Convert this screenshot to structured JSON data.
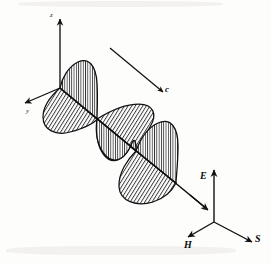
{
  "figure": {
    "background_color": "#fdfdfc",
    "ink_color": "#111111",
    "hatch_color": "#1b1b1b"
  },
  "axes": {
    "origin_left": {
      "x": 60,
      "y": 88
    },
    "origin_right": {
      "x": 214,
      "y": 222
    },
    "items": [
      {
        "name": "z-axis",
        "label": "z",
        "direction": "up",
        "tip": {
          "x": 60,
          "y": 16
        },
        "label_pos": {
          "x": 51,
          "y": 15
        }
      },
      {
        "name": "y-axis",
        "label": "y",
        "direction": "down-left",
        "tip": {
          "x": 22,
          "y": 105
        },
        "label_pos": {
          "x": 26,
          "y": 112
        }
      },
      {
        "name": "x-axis",
        "label": "x",
        "direction": "down-right",
        "tip": {
          "x": 206,
          "y": 208
        },
        "label_pos": {
          "x": 205,
          "y": 209
        }
      },
      {
        "name": "E-vector",
        "label": "E",
        "direction": "up",
        "tip": {
          "x": 214,
          "y": 168
        },
        "label_pos": {
          "x": 201,
          "y": 168
        }
      },
      {
        "name": "H-vector",
        "label": "H",
        "direction": "down-left",
        "tip": {
          "x": 186,
          "y": 238
        },
        "label_pos": {
          "x": 186,
          "y": 244
        }
      },
      {
        "name": "S-vector",
        "label": "S",
        "direction": "down-right",
        "tip": {
          "x": 254,
          "y": 243
        },
        "label_pos": {
          "x": 256,
          "y": 237
        }
      },
      {
        "name": "c-vector",
        "label": "c",
        "direction": "down-right",
        "tip": {
          "x": 163,
          "y": 93
        },
        "label_pos": {
          "x": 165,
          "y": 88
        }
      }
    ]
  },
  "wave": {
    "description": "Transverse electromagnetic plane wave: electric field lobes in the vertical plane, magnetic field lobes in the horizontal plane, propagating along c.",
    "propagation_axis": {
      "start": {
        "x": 60,
        "y": 88
      },
      "end": {
        "x": 212,
        "y": 213
      }
    },
    "lobes": [
      {
        "id": "lobe-e-1",
        "field": "E",
        "plane": "vertical",
        "hatch": "vertical",
        "side": "upper",
        "node_start": {
          "x": 60,
          "y": 88
        },
        "node_end": {
          "x": 97,
          "y": 119
        }
      },
      {
        "id": "lobe-h-1",
        "field": "H",
        "plane": "horizontal",
        "hatch": "diagonal",
        "side": "lower",
        "node_start": {
          "x": 60,
          "y": 88
        },
        "node_end": {
          "x": 97,
          "y": 119
        }
      },
      {
        "id": "lobe-e-2",
        "field": "E",
        "plane": "vertical",
        "hatch": "vertical",
        "side": "lower",
        "node_start": {
          "x": 97,
          "y": 119
        },
        "node_end": {
          "x": 136,
          "y": 151
        }
      },
      {
        "id": "lobe-h-2",
        "field": "H",
        "plane": "horizontal",
        "hatch": "diagonal",
        "side": "upper",
        "node_start": {
          "x": 97,
          "y": 119
        },
        "node_end": {
          "x": 136,
          "y": 151
        }
      },
      {
        "id": "lobe-e-3",
        "field": "E",
        "plane": "vertical",
        "hatch": "vertical",
        "side": "upper",
        "node_start": {
          "x": 136,
          "y": 151
        },
        "node_end": {
          "x": 176,
          "y": 183
        }
      },
      {
        "id": "lobe-h-3",
        "field": "H",
        "plane": "horizontal",
        "hatch": "diagonal",
        "side": "lower",
        "node_start": {
          "x": 136,
          "y": 151
        },
        "node_end": {
          "x": 176,
          "y": 183
        }
      }
    ]
  }
}
